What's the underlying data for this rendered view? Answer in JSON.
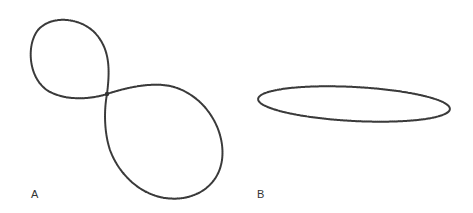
{
  "figure": {
    "panels": [
      {
        "label": "A",
        "description": "figure-eight shaped closed curve with small upper-left loop and larger lower-right loop"
      },
      {
        "label": "B",
        "description": "flat slightly tilted ellipse"
      }
    ],
    "colors": {
      "stroke": "#3a3a3a",
      "background": "#ffffff",
      "label": "#333333"
    }
  }
}
